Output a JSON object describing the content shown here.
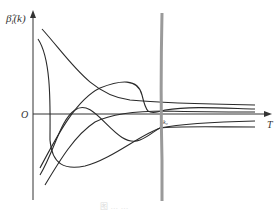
{
  "diagram": {
    "y_axis_label": "β̂ᵢ(k)",
    "y_axis_label_main": "β̂",
    "y_axis_label_sub": "i",
    "y_axis_label_arg": "(k)",
    "origin_label": "O",
    "x_axis_label": "T",
    "marker_label": "k₀",
    "curve_count": 5,
    "caption": "图 … …"
  },
  "colors": {
    "curves": "#2a2a2a",
    "axes": "#333333",
    "divider_line": "#9a9a9a"
  }
}
